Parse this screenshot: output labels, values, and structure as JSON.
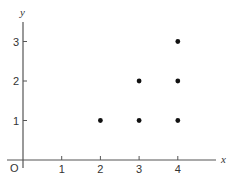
{
  "chart_data": {
    "type": "scatter",
    "title": "",
    "xlabel": "x",
    "ylabel": "y",
    "origin_label": "O",
    "x_ticks": [
      "1",
      "2",
      "3",
      "4"
    ],
    "y_ticks": [
      "1",
      "2",
      "3"
    ],
    "xlim": [
      0,
      4.5
    ],
    "ylim": [
      0,
      3.5
    ],
    "grid": false,
    "legend": null,
    "points": [
      {
        "x": 2,
        "y": 1
      },
      {
        "x": 3,
        "y": 1
      },
      {
        "x": 3,
        "y": 2
      },
      {
        "x": 4,
        "y": 1
      },
      {
        "x": 4,
        "y": 2
      },
      {
        "x": 4,
        "y": 3
      }
    ],
    "colors": {
      "axis": "#555555",
      "point": "#111111"
    }
  }
}
